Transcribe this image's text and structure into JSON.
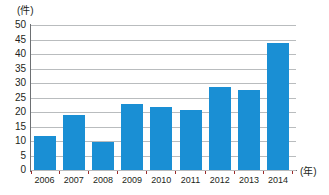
{
  "chart_data": {
    "type": "bar",
    "title": "",
    "subtitle": "",
    "xlabel": "(年)",
    "ylabel": "(件)",
    "categories": [
      "2006",
      "2007",
      "2008",
      "2009",
      "2010",
      "2011",
      "2012",
      "2013",
      "2014"
    ],
    "values": [
      11.7,
      18.8,
      9.8,
      22.8,
      21.8,
      20.8,
      28.6,
      27.6,
      43.7
    ],
    "series": [
      {
        "name": "件数",
        "values": [
          11.7,
          18.8,
          9.8,
          22.8,
          21.8,
          20.8,
          28.6,
          27.6,
          43.7
        ]
      }
    ],
    "ylim": [
      0,
      50
    ],
    "ytick_labels": [
      "50",
      "45",
      "40",
      "35",
      "30",
      "25",
      "20",
      "15",
      "10",
      "5",
      "0"
    ],
    "ytick_values": [
      50,
      45,
      40,
      35,
      30,
      25,
      20,
      15,
      10,
      5,
      0
    ],
    "ytick_interval": 5,
    "grid": true,
    "grid_axis": "y",
    "legend": false,
    "legend_position": "none",
    "bar_color": "#1a8fd4",
    "gridline_color": "#b9bcbe",
    "axis_color": "#6d7073",
    "text_color": "#231f20",
    "background_color": "#ffffff",
    "annotations": []
  }
}
